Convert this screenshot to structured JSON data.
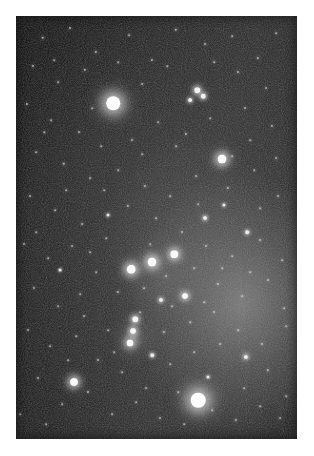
{
  "image": {
    "kind": "astrophotograph",
    "subject": "Orion constellation star field",
    "frame": {
      "border_color": "#ffffff",
      "photo_left": 16,
      "photo_top": 16,
      "photo_width": 281,
      "photo_height": 423
    },
    "sky": {
      "base_color": "#1d1d1d",
      "bright_region_color": "#6e6e6e",
      "dark_corner_color": "#131313",
      "gradient_direction": "brightens toward centre-right and lower-right",
      "grain_opacity": 0.55
    }
  },
  "stars": {
    "named": [
      {
        "name": "betelgeuse",
        "x": 113,
        "y": 103,
        "size": 13.5,
        "glow": 26,
        "brightness": 1.0
      },
      {
        "name": "rigel",
        "x": 198,
        "y": 400,
        "size": 14.5,
        "glow": 29,
        "brightness": 1.0
      },
      {
        "name": "bellatrix",
        "x": 222,
        "y": 159,
        "size": 9.0,
        "glow": 17,
        "brightness": 0.9
      },
      {
        "name": "saiph",
        "x": 74,
        "y": 382,
        "size": 8.0,
        "glow": 15,
        "brightness": 0.88
      },
      {
        "name": "alnitak",
        "x": 131,
        "y": 269,
        "size": 8.5,
        "glow": 16,
        "brightness": 0.92
      },
      {
        "name": "alnilam",
        "x": 152,
        "y": 262,
        "size": 9.0,
        "glow": 17,
        "brightness": 0.94
      },
      {
        "name": "mintaka",
        "x": 174,
        "y": 254,
        "size": 7.5,
        "glow": 14,
        "brightness": 0.86
      },
      {
        "name": "sword-upper",
        "x": 135,
        "y": 319,
        "size": 5.5,
        "glow": 10,
        "brightness": 0.78
      },
      {
        "name": "sword-middle",
        "x": 133,
        "y": 331,
        "size": 6.0,
        "glow": 12,
        "brightness": 0.82
      },
      {
        "name": "sword-lower",
        "x": 130,
        "y": 343,
        "size": 7.0,
        "glow": 14,
        "brightness": 0.85
      },
      {
        "name": "meissa-a",
        "x": 197,
        "y": 90,
        "size": 5.5,
        "glow": 10,
        "brightness": 0.8
      },
      {
        "name": "meissa-b",
        "x": 203,
        "y": 96,
        "size": 4.5,
        "glow": 8,
        "brightness": 0.74
      },
      {
        "name": "meissa-c",
        "x": 190,
        "y": 100,
        "size": 3.8,
        "glow": 7,
        "brightness": 0.68
      },
      {
        "name": "pi-orionis",
        "x": 185,
        "y": 296,
        "size": 6.0,
        "glow": 11,
        "brightness": 0.8
      },
      {
        "name": "eta-orionis",
        "x": 161,
        "y": 300,
        "size": 4.0,
        "glow": 7,
        "brightness": 0.66
      },
      {
        "name": "tau-orionis",
        "x": 246,
        "y": 357,
        "size": 4.2,
        "glow": 8,
        "brightness": 0.68
      },
      {
        "name": "upsilon-orionis",
        "x": 152,
        "y": 355,
        "size": 3.6,
        "glow": 6,
        "brightness": 0.62
      },
      {
        "name": "mu-orionis",
        "x": 205,
        "y": 218,
        "size": 4.0,
        "glow": 7,
        "brightness": 0.64
      },
      {
        "name": "chi-orionis",
        "x": 247,
        "y": 232,
        "size": 3.6,
        "glow": 6,
        "brightness": 0.6
      },
      {
        "name": "phi-orionis",
        "x": 224,
        "y": 205,
        "size": 3.2,
        "glow": 5,
        "brightness": 0.56
      },
      {
        "name": "omega-orionis",
        "x": 108,
        "y": 215,
        "size": 3.0,
        "glow": 5,
        "brightness": 0.54
      },
      {
        "name": "psi-orionis",
        "x": 208,
        "y": 377,
        "size": 3.0,
        "glow": 5,
        "brightness": 0.54
      },
      {
        "name": "rho-orionis",
        "x": 60,
        "y": 270,
        "size": 2.8,
        "glow": 4,
        "brightness": 0.5
      }
    ],
    "field": [
      [
        43,
        38,
        1.5
      ],
      [
        70,
        28,
        1.2
      ],
      [
        96,
        52,
        1.4
      ],
      [
        129,
        35,
        1.1
      ],
      [
        152,
        60,
        1.3
      ],
      [
        176,
        30,
        1.5
      ],
      [
        205,
        44,
        1.2
      ],
      [
        232,
        36,
        1.0
      ],
      [
        258,
        58,
        1.4
      ],
      [
        276,
        33,
        1.1
      ],
      [
        33,
        66,
        1.3
      ],
      [
        58,
        82,
        1.1
      ],
      [
        85,
        70,
        1.5
      ],
      [
        142,
        84,
        1.2
      ],
      [
        167,
        66,
        1.0
      ],
      [
        238,
        72,
        1.3
      ],
      [
        266,
        88,
        1.2
      ],
      [
        27,
        104,
        1.4
      ],
      [
        51,
        120,
        1.1
      ],
      [
        79,
        132,
        1.2
      ],
      [
        101,
        146,
        1.0
      ],
      [
        132,
        140,
        1.3
      ],
      [
        158,
        122,
        1.1
      ],
      [
        186,
        134,
        1.4
      ],
      [
        210,
        118,
        1.0
      ],
      [
        245,
        108,
        1.2
      ],
      [
        272,
        126,
        1.3
      ],
      [
        36,
        152,
        1.1
      ],
      [
        64,
        164,
        1.5
      ],
      [
        90,
        178,
        1.2
      ],
      [
        118,
        170,
        1.0
      ],
      [
        145,
        186,
        1.3
      ],
      [
        170,
        196,
        1.1
      ],
      [
        196,
        176,
        1.2
      ],
      [
        228,
        188,
        1.4
      ],
      [
        254,
        170,
        1.0
      ],
      [
        278,
        196,
        1.2
      ],
      [
        30,
        196,
        1.3
      ],
      [
        55,
        210,
        1.1
      ],
      [
        82,
        224,
        1.2
      ],
      [
        106,
        238,
        1.0
      ],
      [
        128,
        206,
        1.4
      ],
      [
        156,
        218,
        1.1
      ],
      [
        182,
        232,
        1.2
      ],
      [
        206,
        246,
        1.3
      ],
      [
        232,
        256,
        1.0
      ],
      [
        260,
        240,
        1.2
      ],
      [
        282,
        260,
        1.1
      ],
      [
        24,
        244,
        1.3
      ],
      [
        48,
        258,
        1.1
      ],
      [
        72,
        246,
        1.2
      ],
      [
        96,
        272,
        1.0
      ],
      [
        118,
        292,
        1.4
      ],
      [
        144,
        288,
        1.1
      ],
      [
        166,
        276,
        1.2
      ],
      [
        194,
        268,
        1.0
      ],
      [
        218,
        284,
        1.3
      ],
      [
        242,
        296,
        1.1
      ],
      [
        268,
        280,
        1.2
      ],
      [
        284,
        308,
        1.0
      ],
      [
        34,
        288,
        1.3
      ],
      [
        58,
        306,
        1.1
      ],
      [
        84,
        316,
        1.2
      ],
      [
        108,
        330,
        1.0
      ],
      [
        140,
        312,
        1.1
      ],
      [
        164,
        332,
        1.3
      ],
      [
        190,
        322,
        1.0
      ],
      [
        214,
        312,
        1.2
      ],
      [
        238,
        330,
        1.1
      ],
      [
        262,
        344,
        1.3
      ],
      [
        286,
        326,
        1.0
      ],
      [
        28,
        330,
        1.2
      ],
      [
        50,
        346,
        1.1
      ],
      [
        76,
        336,
        1.0
      ],
      [
        98,
        360,
        1.3
      ],
      [
        122,
        372,
        1.1
      ],
      [
        146,
        388,
        1.2
      ],
      [
        170,
        364,
        1.0
      ],
      [
        194,
        352,
        1.1
      ],
      [
        220,
        344,
        1.2
      ],
      [
        244,
        388,
        1.0
      ],
      [
        268,
        370,
        1.3
      ],
      [
        286,
        396,
        1.1
      ],
      [
        38,
        378,
        1.2
      ],
      [
        62,
        404,
        1.0
      ],
      [
        88,
        392,
        1.3
      ],
      [
        112,
        414,
        1.1
      ],
      [
        136,
        402,
        1.0
      ],
      [
        160,
        418,
        1.2
      ],
      [
        184,
        424,
        1.0
      ],
      [
        212,
        410,
        1.1
      ],
      [
        236,
        420,
        1.3
      ],
      [
        260,
        406,
        1.0
      ],
      [
        280,
        418,
        1.2
      ],
      [
        20,
        414,
        1.0
      ],
      [
        46,
        424,
        1.1
      ],
      [
        68,
        360,
        1.0
      ],
      [
        92,
        108,
        1.1
      ],
      [
        118,
        62,
        1.0
      ],
      [
        214,
        62,
        1.1
      ],
      [
        250,
        140,
        1.0
      ],
      [
        276,
        158,
        1.2
      ],
      [
        44,
        132,
        1.0
      ],
      [
        66,
        190,
        1.1
      ],
      [
        104,
        190,
        1.0
      ],
      [
        176,
        146,
        1.1
      ],
      [
        198,
        204,
        1.0
      ],
      [
        260,
        208,
        1.1
      ],
      [
        36,
        232,
        1.0
      ],
      [
        90,
        252,
        1.1
      ],
      [
        150,
        244,
        1.0
      ],
      [
        172,
        306,
        1.1
      ],
      [
        222,
        268,
        1.0
      ],
      [
        250,
        272,
        1.1
      ],
      [
        114,
        352,
        1.0
      ],
      [
        178,
        392,
        1.1
      ],
      [
        204,
        302,
        1.0
      ],
      [
        232,
        156,
        1.1
      ],
      [
        142,
        154,
        1.0
      ],
      [
        80,
        294,
        1.1
      ],
      [
        54,
        60,
        1.0
      ]
    ]
  }
}
